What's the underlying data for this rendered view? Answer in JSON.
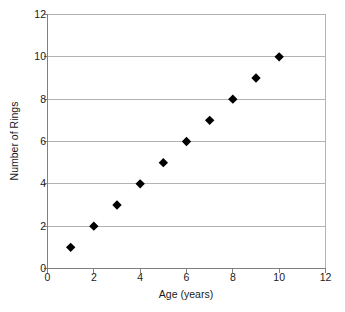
{
  "chart_data": {
    "type": "scatter",
    "title": "",
    "xlabel": "Age (years)",
    "ylabel": "Number of Rings",
    "xlim": [
      0,
      12
    ],
    "ylim": [
      0,
      12
    ],
    "xticks": [
      0,
      2,
      4,
      6,
      8,
      10,
      12
    ],
    "yticks": [
      0,
      2,
      4,
      6,
      8,
      10,
      12
    ],
    "xtick_labels": [
      "0",
      "2",
      "4",
      "6",
      "8",
      "10",
      "12"
    ],
    "ytick_labels": [
      "0",
      "2",
      "4",
      "6",
      "8",
      "10",
      "12"
    ],
    "grid": "horizontal",
    "grid_color": "#b3b3b3",
    "legend": "none",
    "marker": "diamond",
    "marker_color": "#000000",
    "marker_size": 7,
    "axis_color": "#808080",
    "background": "#ffffff",
    "x": [
      1,
      2,
      3,
      4,
      5,
      6,
      7,
      8,
      9,
      10
    ],
    "y": [
      1,
      2,
      3,
      4,
      5,
      6,
      7,
      8,
      9,
      10
    ],
    "points": [
      {
        "x": 1,
        "y": 1
      },
      {
        "x": 2,
        "y": 2
      },
      {
        "x": 3,
        "y": 3
      },
      {
        "x": 4,
        "y": 4
      },
      {
        "x": 5,
        "y": 5
      },
      {
        "x": 6,
        "y": 6
      },
      {
        "x": 7,
        "y": 7
      },
      {
        "x": 8,
        "y": 8
      },
      {
        "x": 9,
        "y": 9
      },
      {
        "x": 10,
        "y": 10
      }
    ]
  },
  "caption": {
    "cutoff_text": ""
  }
}
